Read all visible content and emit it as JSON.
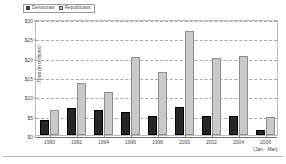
{
  "chart_data": {
    "type": "bar",
    "title": "",
    "xlabel": "",
    "ylabel": "Total (in millions)",
    "ylim": [
      0,
      30
    ],
    "ytick_labels": [
      "$0",
      "$5",
      "$10",
      "$15",
      "$20",
      "$25",
      "$30"
    ],
    "ytick_values": [
      0,
      5,
      10,
      15,
      20,
      25,
      30
    ],
    "grid": true,
    "legend_position": "top-left",
    "categories": [
      "1990",
      "1992",
      "1994",
      "1996",
      "1998",
      "2000",
      "2002",
      "2004",
      "2006"
    ],
    "category_sublabels": [
      "",
      "",
      "",
      "",
      "",
      "",
      "",
      "",
      "(Jan - Mar)"
    ],
    "series": [
      {
        "name": "Democrats",
        "color": "#262626",
        "values": [
          4.0,
          6.9,
          6.4,
          5.9,
          4.9,
          7.3,
          4.8,
          4.8,
          1.4
        ]
      },
      {
        "name": "Republicans",
        "color": "#c9c9c9",
        "values": [
          6.5,
          13.5,
          11.0,
          20.1,
          16.3,
          26.8,
          19.9,
          20.4,
          4.7
        ]
      }
    ]
  }
}
